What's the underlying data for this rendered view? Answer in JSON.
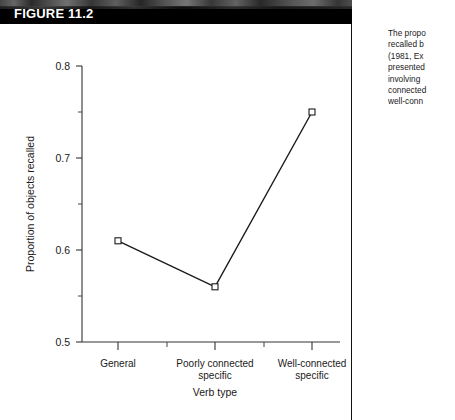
{
  "figure": {
    "banner_label": "FIGURE 11.2"
  },
  "caption": {
    "lines": [
      "The propo",
      "recalled b",
      "(1981, Ex",
      "presented",
      "involving",
      "connected",
      "well-conn"
    ]
  },
  "chart_data": {
    "type": "line",
    "title": "",
    "xlabel": "Verb type",
    "ylabel": "Proportion of objects recalled",
    "categories": [
      "General",
      "Poorly connected specific",
      "Well-connected specific"
    ],
    "category_lines": [
      [
        "General"
      ],
      [
        "Poorly connected",
        "specific"
      ],
      [
        "Well-connected",
        "specific"
      ]
    ],
    "values": [
      0.61,
      0.56,
      0.75
    ],
    "ylim": [
      0.5,
      0.8
    ],
    "yticks": [
      0.5,
      0.6,
      0.7,
      0.8
    ],
    "ytick_labels": [
      "0.5",
      "0.6",
      "0.7",
      "0.8"
    ],
    "yminorticks": [
      0.55,
      0.65,
      0.75
    ],
    "grid": false,
    "legend": null,
    "marker": "open-square",
    "line_color": "#1a1a1a",
    "marker_fill": "#ffffff",
    "marker_edge": "#1a1a1a"
  }
}
